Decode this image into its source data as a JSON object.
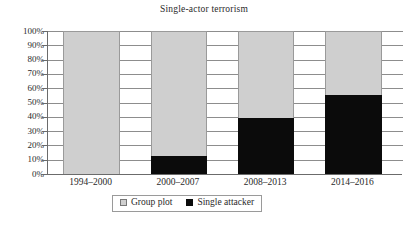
{
  "chart_data": {
    "type": "bar",
    "subtype": "stacked-100-percent",
    "title": "Single-actor terrorism",
    "xlabel": "",
    "ylabel": "",
    "ylim": [
      0,
      100
    ],
    "ytick_labels": [
      "100%",
      "90%",
      "80%",
      "70%",
      "60%",
      "50%",
      "40%",
      "30%",
      "20%",
      "10%",
      "0%"
    ],
    "ytick_values": [
      100,
      90,
      80,
      70,
      60,
      50,
      40,
      30,
      20,
      10,
      0
    ],
    "grid": true,
    "legend_position": "bottom",
    "categories": [
      "1994–2000",
      "2000–2007",
      "2008–2013",
      "2014–2016"
    ],
    "series": [
      {
        "name": "Group plot",
        "color": "#cfcfcf",
        "values": [
          100,
          87.5,
          61,
          45
        ]
      },
      {
        "name": "Single attacker",
        "color": "#0b0b0b",
        "values": [
          0,
          12.5,
          39,
          55
        ]
      }
    ]
  },
  "colors": {
    "group_plot": "#cfcfcf",
    "single_attacker": "#0b0b0b",
    "axis": "#6b6b6b",
    "grid": "#8d8d8d",
    "background": "#ffffff"
  }
}
